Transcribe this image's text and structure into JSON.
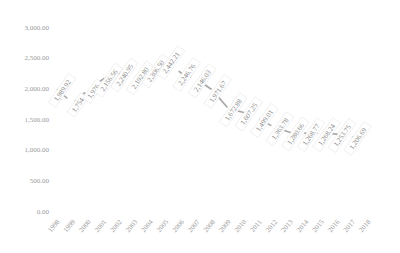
{
  "chart_data": {
    "type": "line",
    "title": "",
    "xlabel": "",
    "ylabel": "",
    "ylim": [
      0,
      3000
    ],
    "yticks": [
      "0.00",
      "500.00",
      "1,000.00",
      "1,500.00",
      "2,000.00",
      "2,500.00",
      "3,000.00"
    ],
    "ytick_values": [
      0,
      500,
      1000,
      1500,
      2000,
      2500,
      3000
    ],
    "categories": [
      "1998",
      "1999",
      "2000",
      "2001",
      "2002",
      "2003",
      "2004",
      "2005",
      "2006",
      "2007",
      "2008",
      "2009",
      "2010",
      "2011",
      "2012",
      "2013",
      "2014",
      "2015",
      "2016",
      "2017",
      "2018"
    ],
    "series": [
      {
        "name": "Series 1",
        "color": "#a6a6a6",
        "values": [
          1989.92,
          1754.0,
          1976.0,
          2156.56,
          2240.95,
          2192.8,
          2306.5,
          2442.21,
          2246.76,
          2146.03,
          1971.67,
          1672.88,
          1607.25,
          1499.01,
          1363.78,
          1280.66,
          1268.77,
          1268.24,
          1253.75,
          1206.69,
          null
        ],
        "labels": [
          "1,989.92",
          "1,754",
          "1,976",
          "2,156.56",
          "2,240.95",
          "2,192.80",
          "2,306.50",
          "2,442.21",
          "2,246.76",
          "2,146.03",
          "1,971.67",
          "1,672.88",
          "1,607.25",
          "1,499.01",
          "1,363.78",
          "1,280.66",
          "1,268.77",
          "1,268.24",
          "1,253.75",
          "1,206.69",
          ""
        ]
      }
    ],
    "grid": false,
    "legend": "none",
    "data_labels": "rotated -55deg, boxed"
  }
}
